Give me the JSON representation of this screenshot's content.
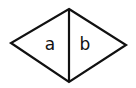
{
  "diagram": {
    "shape": "rhombus",
    "stroke_color": "#111111",
    "vertices": {
      "top": [
        69,
        9
      ],
      "right": [
        126,
        45
      ],
      "bottom": [
        69,
        82
      ],
      "left": [
        11,
        43
      ]
    },
    "divider": "vertical line from top vertex to bottom vertex",
    "regions": [
      {
        "label": "a",
        "position": [
          50,
          50
        ]
      },
      {
        "label": "b",
        "position": [
          85,
          50
        ]
      }
    ]
  }
}
